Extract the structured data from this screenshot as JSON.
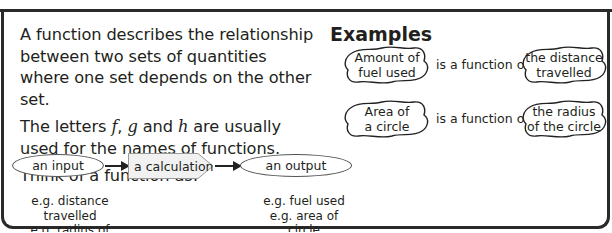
{
  "intro": {
    "paragraph1": "A function describes the relationship between two sets of quantities where one set depends on the other set.",
    "paragraph2_prefix": "The letters ",
    "letter_f": "f",
    "sep1": ", ",
    "letter_g": "g",
    "sep2": " and ",
    "letter_h": "h",
    "paragraph2_suffix": " are usually used for the names of functions.",
    "paragraph3": "Think of a function as:"
  },
  "flow": {
    "input_label": "an input",
    "calculation_label": "a calculation",
    "output_label": "an output",
    "input_examples": [
      "e.g. distance travelled",
      "e.g. radius of circle"
    ],
    "output_examples": [
      "e.g. fuel used",
      "e.g. area of circle"
    ]
  },
  "examples": {
    "title": "Examples",
    "connector": "is a function of",
    "rows": [
      {
        "dependent": [
          "Amount of",
          "fuel used"
        ],
        "independent": [
          "the distance",
          "travelled"
        ]
      },
      {
        "dependent": [
          "Area of",
          "a circle"
        ],
        "independent": [
          "the radius",
          "of the circle"
        ]
      }
    ]
  },
  "colors": {
    "frame": "#2a2a2a",
    "text": "#231f20",
    "calc_fill": "#f1f1f1"
  }
}
